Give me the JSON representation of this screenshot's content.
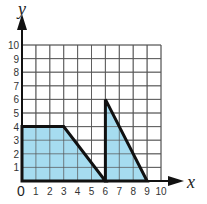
{
  "chart_data": {
    "type": "area",
    "title": "",
    "xlabel": "x",
    "ylabel": "y",
    "xlim": [
      0,
      10
    ],
    "ylim": [
      0,
      10
    ],
    "grid": true,
    "x_ticks": [
      "0",
      "1",
      "2",
      "3",
      "4",
      "5",
      "6",
      "7",
      "8",
      "9",
      "10"
    ],
    "y_ticks": [
      "1",
      "2",
      "3",
      "4",
      "5",
      "6",
      "7",
      "8",
      "9",
      "10"
    ],
    "origin_label": "0",
    "fill_color": "#A6DCF0",
    "stroke_color": "#111111",
    "grid_color": "#555555",
    "shapes": [
      {
        "name": "trapezoid",
        "points": [
          [
            0,
            0
          ],
          [
            0,
            4
          ],
          [
            3,
            4
          ],
          [
            6,
            0
          ]
        ]
      },
      {
        "name": "triangle",
        "points": [
          [
            6,
            0
          ],
          [
            6,
            6
          ],
          [
            9,
            0
          ]
        ]
      }
    ]
  }
}
